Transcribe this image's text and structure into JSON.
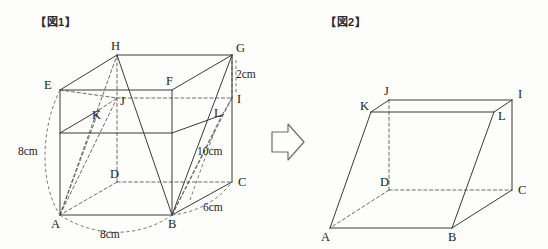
{
  "figures": {
    "fig1": {
      "label": "【図1】",
      "caption_text": "【図1】",
      "shape": "rectangular prism with cut plane",
      "vertices": [
        {
          "id": "A",
          "label": "A",
          "x": 60,
          "y": 215,
          "lx": 51,
          "ly": 228,
          "hidden": false
        },
        {
          "id": "B",
          "label": "B",
          "x": 172,
          "y": 215,
          "lx": 168,
          "ly": 228,
          "hidden": false
        },
        {
          "id": "C",
          "label": "C",
          "x": 232,
          "y": 182,
          "lx": 238,
          "ly": 186,
          "hidden": false
        },
        {
          "id": "D",
          "label": "D",
          "x": 117,
          "y": 182,
          "lx": 110,
          "ly": 178,
          "hidden": true
        },
        {
          "id": "E",
          "label": "E",
          "x": 60,
          "y": 90,
          "lx": 44,
          "ly": 89,
          "hidden": false
        },
        {
          "id": "F",
          "label": "F",
          "x": 172,
          "y": 90,
          "lx": 166,
          "ly": 85,
          "hidden": false
        },
        {
          "id": "G",
          "label": "G",
          "x": 232,
          "y": 55,
          "lx": 236,
          "ly": 52,
          "hidden": false
        },
        {
          "id": "H",
          "label": "H",
          "x": 117,
          "y": 55,
          "lx": 111,
          "ly": 50,
          "hidden": false
        },
        {
          "id": "I",
          "label": "I",
          "x": 232,
          "y": 98,
          "lx": 237,
          "ly": 103,
          "hidden": false
        },
        {
          "id": "J",
          "label": "J",
          "x": 117,
          "y": 98,
          "lx": 120,
          "ly": 105,
          "hidden": true
        },
        {
          "id": "K",
          "label": "K",
          "x": 99,
          "y": 110,
          "lx": 92,
          "ly": 119,
          "hidden": true
        },
        {
          "id": "L",
          "label": "L",
          "x": 222,
          "y": 115,
          "lx": 214,
          "ly": 117,
          "hidden": false
        }
      ],
      "dimensions": [
        {
          "id": "height-left",
          "text": "8cm",
          "x": 18,
          "y": 155
        },
        {
          "id": "edge-gi",
          "text": "2cm",
          "x": 236,
          "y": 78
        },
        {
          "id": "diagonal-bg",
          "text": "10cm",
          "x": 197,
          "y": 155
        },
        {
          "id": "depth-bc",
          "text": "6cm",
          "x": 203,
          "y": 211
        },
        {
          "id": "width-ab",
          "text": "8cm",
          "x": 100,
          "y": 238
        }
      ]
    },
    "fig2": {
      "label": "【図2】",
      "caption_text": "【図2】",
      "shape": "resulting solid after cut",
      "vertices": [
        {
          "id": "A",
          "label": "A",
          "x": 330,
          "y": 228,
          "lx": 321,
          "ly": 241,
          "hidden": false
        },
        {
          "id": "B",
          "label": "B",
          "x": 452,
          "y": 228,
          "lx": 448,
          "ly": 241,
          "hidden": false
        },
        {
          "id": "C",
          "label": "C",
          "x": 512,
          "y": 190,
          "lx": 518,
          "ly": 194,
          "hidden": false
        },
        {
          "id": "D",
          "label": "D",
          "x": 389,
          "y": 190,
          "lx": 380,
          "ly": 186,
          "hidden": true
        },
        {
          "id": "I",
          "label": "I",
          "x": 512,
          "y": 100,
          "lx": 518,
          "ly": 98,
          "hidden": false
        },
        {
          "id": "J",
          "label": "J",
          "x": 389,
          "y": 100,
          "lx": 384,
          "ly": 95,
          "hidden": false
        },
        {
          "id": "K",
          "label": "K",
          "x": 371,
          "y": 112,
          "lx": 360,
          "ly": 110,
          "hidden": false
        },
        {
          "id": "L",
          "label": "L",
          "x": 494,
          "y": 112,
          "lx": 498,
          "ly": 120,
          "hidden": false
        }
      ]
    }
  },
  "arrow": {
    "name": "transform-arrow",
    "direction": "right"
  },
  "colors": {
    "line_solid": "#3a3a3a",
    "line_hidden": "#5a5a5a",
    "text": "#1d1d1d",
    "background": "#fdfdfb"
  }
}
